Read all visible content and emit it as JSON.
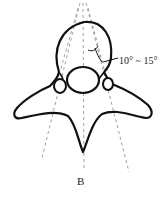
{
  "figure": {
    "panel_label": "B",
    "angle_annotation": "10° ~ 15°",
    "colors": {
      "outline": "#111111",
      "dashed_lines": "#888888",
      "background": "#ffffff"
    }
  }
}
